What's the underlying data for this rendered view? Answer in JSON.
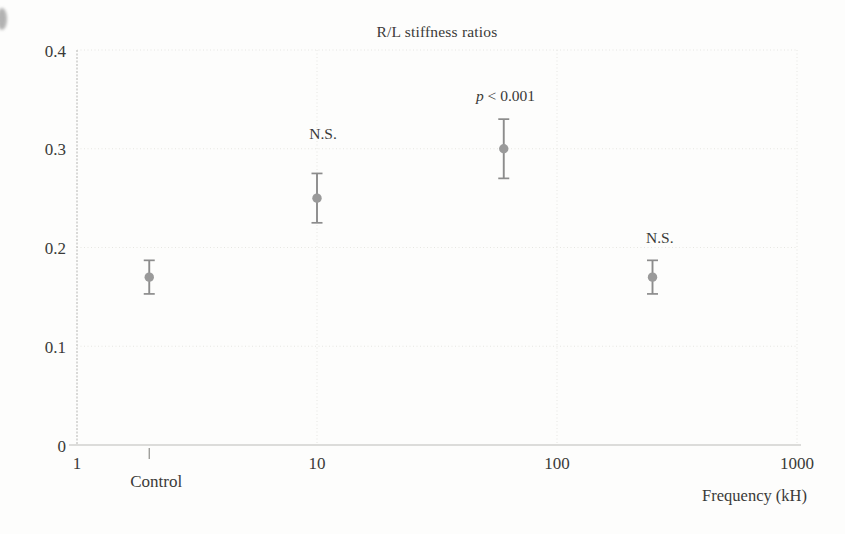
{
  "figure": {
    "background_color": "#fdfdfc",
    "text_color": "#3a3a38"
  },
  "chart_data": {
    "type": "scatter",
    "title": "R/L stiffness ratios",
    "xlabel": "Frequency (kH)",
    "ylabel": "",
    "x_scale": "log",
    "xlim": [
      1,
      1000
    ],
    "ylim": [
      0,
      0.4
    ],
    "grid": true,
    "legend": false,
    "x_ticks": [
      {
        "value": 1,
        "label": "1"
      },
      {
        "value": 10,
        "label": "10"
      },
      {
        "value": 100,
        "label": "100"
      },
      {
        "value": 1000,
        "label": "1000"
      }
    ],
    "y_ticks": [
      {
        "value": 0,
        "label": "0"
      },
      {
        "value": 0.1,
        "label": "0.1"
      },
      {
        "value": 0.2,
        "label": "0.2"
      },
      {
        "value": 0.3,
        "label": "0.3"
      },
      {
        "value": 0.4,
        "label": "0.4"
      }
    ],
    "control_tick": {
      "x": 2,
      "label": "Control"
    },
    "series": [
      {
        "name": "R/L stiffness ratio",
        "marker": "circle",
        "points": [
          {
            "x": 2,
            "y": 0.17,
            "error": 0.017,
            "category": "Control",
            "significance": ""
          },
          {
            "x": 10,
            "y": 0.25,
            "error": 0.025,
            "category": "10 kH",
            "significance": "N.S."
          },
          {
            "x": 60,
            "y": 0.3,
            "error": 0.03,
            "category": "60 kH",
            "significance": "p < 0.001"
          },
          {
            "x": 250,
            "y": 0.17,
            "error": 0.017,
            "category": "250 kH",
            "significance": "N.S."
          }
        ]
      }
    ],
    "annotations": [
      {
        "text": "N.S.",
        "x": 10.6,
        "y": 0.315,
        "italic_first_token": false
      },
      {
        "text": "p < 0.001",
        "x": 61,
        "y": 0.354,
        "italic_first_token": true
      },
      {
        "text": "N.S.",
        "x": 268,
        "y": 0.21,
        "italic_first_token": false
      }
    ]
  },
  "colors": {
    "marker": "#9a9a9a",
    "error_bar": "#8c8c8c",
    "grid": "#e6e6e2",
    "axis": "#bcbcb8",
    "text": "#3a3a38"
  }
}
